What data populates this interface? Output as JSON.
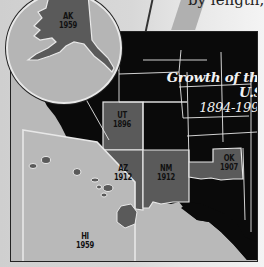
{
  "header": {
    "fragment_text": "by length,"
  },
  "map": {
    "title": "Growth of the U.S.",
    "years_range": "1894-1994",
    "colors": {
      "background_page": "#d4d4d4",
      "water": "#b9b9b9",
      "existing_states": "#0a0a0a",
      "new_states": "#5a5a5a",
      "borders": "#e8e8e8",
      "title_text": "#f2f2f2"
    },
    "states": [
      {
        "abbr": "AK",
        "year": "1959"
      },
      {
        "abbr": "UT",
        "year": "1896"
      },
      {
        "abbr": "AZ",
        "year": "1912"
      },
      {
        "abbr": "NM",
        "year": "1912"
      },
      {
        "abbr": "OK",
        "year": "1907"
      },
      {
        "abbr": "HI",
        "year": "1959"
      }
    ]
  }
}
